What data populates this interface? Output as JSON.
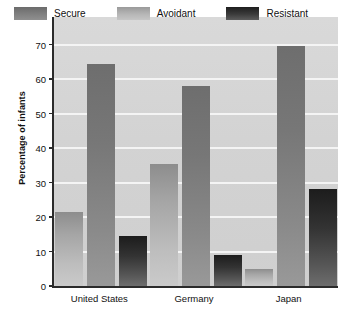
{
  "chart_data": {
    "type": "bar",
    "title": "",
    "xlabel": "",
    "ylabel": "Percentage of infants",
    "ylim": [
      0,
      78
    ],
    "yticks": [
      0,
      10,
      20,
      30,
      40,
      50,
      60,
      70
    ],
    "ytick_labels": [
      "0",
      "10",
      "20",
      "30",
      "40",
      "50",
      "60",
      "70"
    ],
    "grid": true,
    "legend_position": "top",
    "categories": [
      "United States",
      "Germany",
      "Japan"
    ],
    "series": [
      {
        "name": "Secure",
        "values": [
          64.5,
          58.0,
          69.5
        ]
      },
      {
        "name": "Avoidant",
        "values": [
          21.5,
          35.5,
          5.0
        ]
      },
      {
        "name": "Resistant",
        "values": [
          14.5,
          9.0,
          28.0
        ]
      }
    ],
    "bar_draw_order": [
      "Avoidant",
      "Secure",
      "Resistant"
    ],
    "colors": {
      "Secure": "#7d7d7d",
      "Avoidant": "#b4b4b4",
      "Resistant": "#2b2b2b",
      "plot_background": "#d4d4d4",
      "gridline": "#f4f4f4",
      "axis": "#2b2b2b",
      "text": "#111111"
    }
  },
  "legend": {
    "items": [
      {
        "label": "Secure",
        "key": "secure"
      },
      {
        "label": "Avoidant",
        "key": "avoidant"
      },
      {
        "label": "Resistant",
        "key": "resistant"
      }
    ]
  },
  "axes": {
    "y_title": "Percentage of infants",
    "y_tick_labels": [
      "70",
      "60",
      "50",
      "40",
      "30",
      "20",
      "10",
      "0"
    ],
    "x_tick_labels": [
      "United States",
      "Germany",
      "Japan"
    ]
  }
}
